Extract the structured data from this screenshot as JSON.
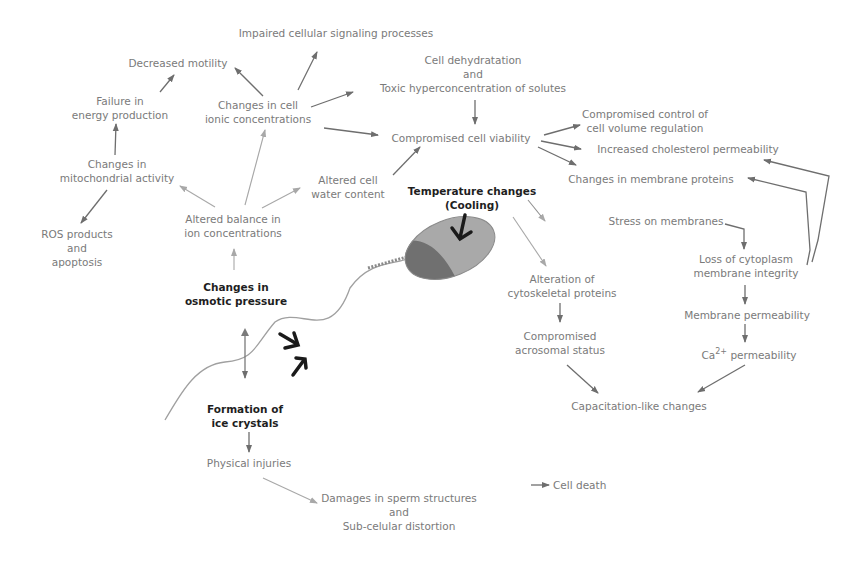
{
  "diagram": {
    "nodes": {
      "impaired_signaling": {
        "lines": [
          "Impaired cellular signaling processes"
        ]
      },
      "decreased_motility": {
        "lines": [
          "Decreased motility"
        ]
      },
      "cell_dehydration": {
        "lines": [
          "Cell dehydratation",
          "and",
          "Toxic hyperconcentration of solutes"
        ]
      },
      "failure_energy": {
        "lines": [
          "Failure in",
          "energy production"
        ]
      },
      "ionic_changes": {
        "lines": [
          "Changes in cell",
          "ionic concentrations"
        ]
      },
      "compromised_viability": {
        "lines": [
          "Compromised cell viability"
        ]
      },
      "volume_control": {
        "lines": [
          "Compromised control of",
          "cell volume regulation"
        ]
      },
      "cholesterol": {
        "lines": [
          "Increased cholesterol permeability"
        ]
      },
      "mito_activity": {
        "lines": [
          "Changes in",
          "mitochondrial activity"
        ]
      },
      "membrane_proteins": {
        "lines": [
          "Changes in membrane proteins"
        ]
      },
      "water_content": {
        "lines": [
          "Altered cell",
          "water content"
        ]
      },
      "temperature": {
        "lines": [
          "Temperature changes",
          "(Cooling)"
        ]
      },
      "stress_membranes": {
        "lines": [
          "Stress on membranes"
        ]
      },
      "ros": {
        "lines": [
          "ROS products",
          "and",
          "apoptosis"
        ]
      },
      "ion_balance": {
        "lines": [
          "Altered balance in",
          "ion concentrations"
        ]
      },
      "loss_integrity": {
        "lines": [
          "Loss of cytoplasm",
          "membrane integrity"
        ]
      },
      "osmotic": {
        "lines": [
          "Changes in",
          "osmotic pressure"
        ]
      },
      "cytoskeletal": {
        "lines": [
          "Alteration of",
          "cytoskeletal proteins"
        ]
      },
      "membrane_perm": {
        "lines": [
          "Membrane permeability"
        ]
      },
      "acrosomal": {
        "lines": [
          "Compromised",
          "acrosomal status"
        ]
      },
      "ca_perm": {
        "prefix": "Ca",
        "sup": "2+",
        "suffix": " permeability"
      },
      "capacitation": {
        "lines": [
          "Capacitation-like changes"
        ]
      },
      "ice_crystals": {
        "lines": [
          "Formation of",
          "ice crystals"
        ]
      },
      "physical_injuries": {
        "lines": [
          "Physical injuries"
        ]
      },
      "damages": {
        "lines": [
          "Damages in sperm structures",
          "and",
          "Sub-celular distortion"
        ]
      },
      "cell_death": {
        "lines": [
          "Cell death"
        ]
      }
    },
    "colors": {
      "text_light": "#7a7a7a",
      "text_bold": "#1e1e1e",
      "arrow": "#6e6e6e",
      "arrow_light": "#a8a8a8",
      "bold_arrow": "#1a1a1a",
      "sperm_head_dark": "#6f6f6f",
      "sperm_head_light": "#a9a9a9"
    }
  }
}
